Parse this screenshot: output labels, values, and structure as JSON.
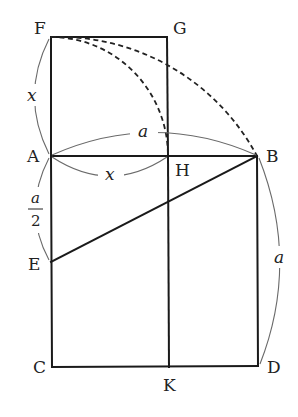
{
  "diagram": {
    "points": {
      "F": {
        "label": "F",
        "x": 51,
        "y": 37
      },
      "G": {
        "label": "G",
        "x": 167,
        "y": 37
      },
      "A": {
        "label": "A",
        "x": 51,
        "y": 156
      },
      "H": {
        "label": "H",
        "x": 168,
        "y": 156
      },
      "B": {
        "label": "B",
        "x": 257,
        "y": 156
      },
      "E": {
        "label": "E",
        "x": 51,
        "y": 262
      },
      "C": {
        "label": "C",
        "x": 52,
        "y": 367
      },
      "K": {
        "label": "K",
        "x": 169,
        "y": 367
      },
      "D": {
        "label": "D",
        "x": 258,
        "y": 366
      }
    },
    "segments": [
      "FG",
      "GH",
      "FA",
      "AB",
      "AC",
      "CD",
      "BD",
      "HK",
      "EB"
    ],
    "dashed_arcs": [
      {
        "from": "F",
        "to": "H",
        "center": "A"
      },
      {
        "from": "F",
        "to": "B",
        "center": "E"
      }
    ],
    "measure_labels": {
      "FA": "x",
      "AB": "a",
      "AH": "x",
      "AE_num": "a",
      "AE_den": "2",
      "BD": "a"
    }
  }
}
